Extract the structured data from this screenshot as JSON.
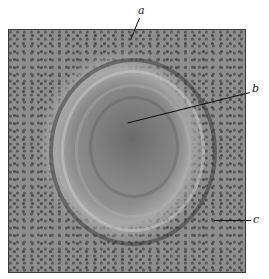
{
  "figure": {
    "labels": [
      {
        "id": "a",
        "text": "a"
      },
      {
        "id": "b",
        "text": "b"
      },
      {
        "id": "c",
        "text": "c"
      }
    ]
  }
}
